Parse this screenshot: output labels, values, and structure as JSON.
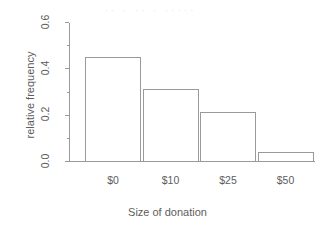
{
  "chart_data": {
    "type": "bar",
    "title": "",
    "subtitle": "",
    "xlabel": "Size of donation",
    "ylabel": "relative frequency",
    "categories": [
      "$0",
      "$10",
      "$25",
      "$50"
    ],
    "values": [
      0.45,
      0.31,
      0.21,
      0.04
    ],
    "series": [
      {
        "name": "relative frequency",
        "values": [
          0.45,
          0.31,
          0.21,
          0.04
        ]
      }
    ],
    "ylim": [
      0.0,
      0.6
    ],
    "ytick_labels": [
      "0.0",
      "0.2",
      "0.4",
      "0.6"
    ],
    "ytick_values": [
      0.0,
      0.2,
      0.4,
      0.6
    ],
    "yminor_tick_values": [
      0.1,
      0.3,
      0.5
    ],
    "grid": false,
    "legend": false,
    "legend_position": "none",
    "bar_fill": "#ffffff",
    "bar_stroke": "#9a9a9a",
    "axis_color": "#9a9a9a",
    "text_color": "#5d5d5d",
    "background": "#ffffff"
  },
  "artifact": {
    "text": "··  · ··  · ·····"
  }
}
